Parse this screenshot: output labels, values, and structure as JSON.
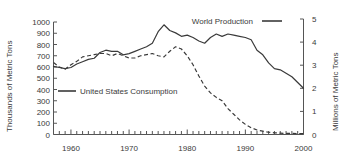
{
  "chart_data": {
    "type": "line",
    "title": "",
    "xlabel": "",
    "ylabel": "Thousands of Metric Tons",
    "ylabel_right": "Millions of Metric Tons",
    "xlim": [
      1957,
      2000
    ],
    "ylim": [
      0,
      1000
    ],
    "ylim_right": [
      0,
      5
    ],
    "grid": false,
    "legend_position": "inside",
    "xticks": [
      1960,
      1970,
      1980,
      1990,
      2000
    ],
    "xtick_labels": [
      "1960",
      "1970",
      "1980",
      "1990",
      "2000"
    ],
    "xticks_minor_step": 1,
    "yticks": [
      0,
      100,
      200,
      300,
      400,
      500,
      600,
      700,
      800,
      900,
      1000
    ],
    "ytick_labels": [
      "0",
      "100",
      "200",
      "300",
      "400",
      "500",
      "600",
      "700",
      "800",
      "900",
      "1000"
    ],
    "yticks_right": [
      0,
      1,
      2,
      3,
      4,
      5
    ],
    "ytick_labels_right": [
      "0",
      "1",
      "2",
      "3",
      "4",
      "5"
    ],
    "series": [
      {
        "name": "World Production",
        "axis": "right",
        "units": "Millions of Metric Tons",
        "style": "solid",
        "color": "#3a3a3a",
        "x": [
          1957,
          1958,
          1959,
          1960,
          1961,
          1962,
          1963,
          1964,
          1965,
          1966,
          1967,
          1968,
          1969,
          1970,
          1971,
          1972,
          1973,
          1974,
          1975,
          1976,
          1977,
          1978,
          1979,
          1980,
          1981,
          1982,
          1983,
          1984,
          1985,
          1986,
          1987,
          1988,
          1989,
          1990,
          1991,
          1992,
          1993,
          1994,
          1995,
          1996,
          1997,
          1998,
          1999,
          2000
        ],
        "values": [
          2.95,
          2.9,
          2.85,
          2.9,
          3.05,
          3.15,
          3.25,
          3.3,
          3.55,
          3.65,
          3.6,
          3.6,
          3.45,
          3.5,
          3.6,
          3.7,
          3.8,
          3.95,
          4.45,
          4.75,
          4.5,
          4.4,
          4.25,
          4.3,
          4.2,
          4.05,
          3.95,
          4.2,
          4.35,
          4.25,
          4.35,
          4.3,
          4.25,
          4.2,
          4.1,
          3.65,
          3.45,
          3.1,
          2.85,
          2.8,
          2.65,
          2.5,
          2.25,
          2.0
        ]
      },
      {
        "name": "United States Consumption",
        "axis": "left",
        "units": "Thousands of Metric Tons",
        "style": "dashed",
        "color": "#3a3a3a",
        "x": [
          1957,
          1958,
          1959,
          1960,
          1961,
          1962,
          1963,
          1964,
          1965,
          1966,
          1967,
          1968,
          1969,
          1970,
          1971,
          1972,
          1973,
          1974,
          1975,
          1976,
          1977,
          1978,
          1979,
          1980,
          1981,
          1982,
          1983,
          1984,
          1985,
          1986,
          1987,
          1988,
          1989,
          1990,
          1991,
          1992,
          1993,
          1994,
          1995,
          1996,
          1997,
          1998,
          1999,
          2000
        ],
        "values": [
          640,
          600,
          580,
          620,
          650,
          690,
          700,
          710,
          720,
          720,
          700,
          720,
          700,
          680,
          680,
          700,
          710,
          720,
          700,
          690,
          740,
          780,
          760,
          700,
          620,
          520,
          430,
          370,
          330,
          300,
          230,
          180,
          130,
          90,
          60,
          40,
          30,
          20,
          15,
          12,
          10,
          10,
          8,
          8
        ]
      }
    ],
    "annotations": [
      {
        "text": "World Production",
        "x_px": 253,
        "y_px": 21
      },
      {
        "text": "United States Consumption",
        "x_px": 150,
        "y_px": 92
      }
    ]
  },
  "legend": {
    "world_production": "World Production",
    "us_consumption": "United States Consumption"
  },
  "axes": {
    "left_title": "Thousands of Metric Tons",
    "right_title": "Millions of Metric Tons"
  }
}
